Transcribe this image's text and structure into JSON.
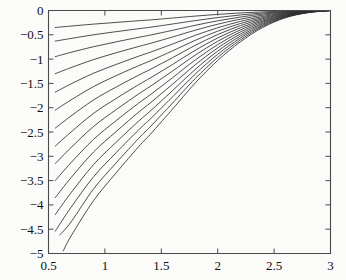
{
  "chart_data": {
    "type": "line",
    "title": "",
    "subtitle": "",
    "xlabel": "",
    "ylabel": "",
    "xlim": [
      0.5,
      3.0
    ],
    "ylim": [
      -5.0,
      0.0
    ],
    "grid": false,
    "legend": "none",
    "legend_entries": [],
    "annotations": [],
    "x_ticks": [
      0.5,
      1,
      1.5,
      2,
      2.5,
      3
    ],
    "x_tick_labels": [
      "0.5",
      "1",
      "1.5",
      "2",
      "2.5",
      "3"
    ],
    "y_ticks": [
      0,
      -0.5,
      -1,
      -1.5,
      -2,
      -2.5,
      -3,
      -3.5,
      -4,
      -4.5,
      -5
    ],
    "y_tick_labels": [
      "0",
      "−0.5",
      "−1",
      "−1.5",
      "−2",
      "−2.5",
      "−3",
      "−3.5",
      "−4",
      "−4.5",
      "−5"
    ],
    "right_axis_minor_ticks": 10,
    "top_axis_minor_ticks": 5,
    "line_color": "#2e2e2e",
    "axis_color": "#4a4a4a",
    "background_color": "#fbfbfa",
    "series_count": 15,
    "series": [
      {
        "name": "curve-1",
        "x": [
          0.56,
          0.7,
          0.9,
          1.1,
          1.3,
          1.4,
          1.5,
          1.6,
          1.8,
          2.0,
          2.2,
          2.4,
          2.6,
          2.8,
          3.0
        ],
        "values": [
          -0.35,
          -0.32,
          -0.28,
          -0.245,
          -0.21,
          -0.195,
          -0.175,
          -0.155,
          -0.115,
          -0.08,
          -0.05,
          -0.028,
          -0.012,
          -0.004,
          0.0
        ]
      },
      {
        "name": "curve-2",
        "x": [
          0.56,
          0.7,
          0.9,
          1.1,
          1.3,
          1.4,
          1.5,
          1.6,
          1.8,
          2.0,
          2.2,
          2.4,
          2.6,
          2.8,
          3.0
        ],
        "values": [
          -0.63,
          -0.575,
          -0.5,
          -0.435,
          -0.375,
          -0.345,
          -0.312,
          -0.278,
          -0.208,
          -0.145,
          -0.092,
          -0.05,
          -0.022,
          -0.007,
          0.0
        ]
      },
      {
        "name": "curve-3",
        "x": [
          0.56,
          0.7,
          0.9,
          1.1,
          1.3,
          1.4,
          1.5,
          1.6,
          1.8,
          2.0,
          2.2,
          2.4,
          2.6,
          2.8,
          3.0
        ],
        "values": [
          -0.95,
          -0.86,
          -0.745,
          -0.645,
          -0.552,
          -0.507,
          -0.458,
          -0.408,
          -0.305,
          -0.212,
          -0.135,
          -0.073,
          -0.032,
          -0.01,
          0.0
        ]
      },
      {
        "name": "curve-4",
        "x": [
          0.56,
          0.7,
          0.9,
          1.1,
          1.3,
          1.4,
          1.5,
          1.6,
          1.8,
          2.0,
          2.2,
          2.4,
          2.6,
          2.8,
          3.0
        ],
        "values": [
          -1.3,
          -1.175,
          -1.01,
          -0.87,
          -0.74,
          -0.678,
          -0.612,
          -0.545,
          -0.406,
          -0.282,
          -0.179,
          -0.097,
          -0.042,
          -0.013,
          0.0
        ]
      },
      {
        "name": "curve-5",
        "x": [
          0.56,
          0.7,
          0.9,
          1.1,
          1.3,
          1.4,
          1.5,
          1.6,
          1.8,
          2.0,
          2.2,
          2.4,
          2.6,
          2.8,
          3.0
        ],
        "values": [
          -1.68,
          -1.51,
          -1.29,
          -1.11,
          -0.94,
          -0.86,
          -0.775,
          -0.69,
          -0.512,
          -0.355,
          -0.225,
          -0.122,
          -0.053,
          -0.016,
          0.0
        ]
      },
      {
        "name": "curve-6",
        "x": [
          0.56,
          0.7,
          0.9,
          1.1,
          1.3,
          1.4,
          1.5,
          1.6,
          1.8,
          2.0,
          2.2,
          2.4,
          2.6,
          2.8,
          3.0
        ],
        "values": [
          -2.05,
          -1.84,
          -1.565,
          -1.34,
          -1.135,
          -1.038,
          -0.935,
          -0.83,
          -0.615,
          -0.425,
          -0.269,
          -0.146,
          -0.063,
          -0.019,
          0.0
        ]
      },
      {
        "name": "curve-7",
        "x": [
          0.56,
          0.7,
          0.9,
          1.1,
          1.3,
          1.4,
          1.5,
          1.6,
          1.8,
          2.0,
          2.2,
          2.4,
          2.6,
          2.8,
          3.0
        ],
        "values": [
          -2.42,
          -2.17,
          -1.84,
          -1.575,
          -1.33,
          -1.215,
          -1.093,
          -0.97,
          -0.718,
          -0.495,
          -0.313,
          -0.169,
          -0.073,
          -0.022,
          0.0
        ]
      },
      {
        "name": "curve-8",
        "x": [
          0.56,
          0.7,
          0.9,
          1.1,
          1.3,
          1.4,
          1.5,
          1.6,
          1.8,
          2.0,
          2.2,
          2.4,
          2.6,
          2.8,
          3.0
        ],
        "values": [
          -2.79,
          -2.5,
          -2.115,
          -1.81,
          -1.525,
          -1.392,
          -1.251,
          -1.11,
          -0.82,
          -0.565,
          -0.357,
          -0.193,
          -0.083,
          -0.025,
          0.0
        ]
      },
      {
        "name": "curve-9",
        "x": [
          0.56,
          0.7,
          0.9,
          1.1,
          1.3,
          1.4,
          1.5,
          1.6,
          1.8,
          2.0,
          2.2,
          2.4,
          2.6,
          2.8,
          3.0
        ],
        "values": [
          -3.15,
          -2.82,
          -2.385,
          -2.04,
          -1.715,
          -1.565,
          -1.405,
          -1.245,
          -0.92,
          -0.633,
          -0.4,
          -0.216,
          -0.093,
          -0.028,
          0.0
        ]
      },
      {
        "name": "curve-10",
        "x": [
          0.56,
          0.7,
          0.9,
          1.1,
          1.3,
          1.4,
          1.5,
          1.6,
          1.8,
          2.0,
          2.2,
          2.4,
          2.6,
          2.8,
          3.0
        ],
        "values": [
          -3.5,
          -3.13,
          -2.65,
          -2.265,
          -1.905,
          -1.738,
          -1.56,
          -1.382,
          -1.02,
          -0.702,
          -0.443,
          -0.239,
          -0.103,
          -0.031,
          0.0
        ]
      },
      {
        "name": "curve-11",
        "x": [
          0.56,
          0.7,
          0.9,
          1.1,
          1.3,
          1.4,
          1.5,
          1.6,
          1.8,
          2.0,
          2.2,
          2.4,
          2.6,
          2.8,
          3.0
        ],
        "values": [
          -3.85,
          -3.44,
          -2.91,
          -2.49,
          -2.09,
          -1.908,
          -1.712,
          -1.516,
          -1.119,
          -0.77,
          -0.486,
          -0.262,
          -0.113,
          -0.034,
          0.0
        ]
      },
      {
        "name": "curve-12",
        "x": [
          0.56,
          0.7,
          0.9,
          1.1,
          1.3,
          1.4,
          1.5,
          1.6,
          1.8,
          2.0,
          2.2,
          2.4,
          2.6,
          2.8,
          3.0
        ],
        "values": [
          -4.2,
          -3.75,
          -3.17,
          -2.71,
          -2.275,
          -2.075,
          -1.862,
          -1.648,
          -1.215,
          -0.836,
          -0.527,
          -0.284,
          -0.122,
          -0.037,
          0.0
        ]
      },
      {
        "name": "curve-13",
        "x": [
          0.56,
          0.7,
          0.9,
          1.1,
          1.3,
          1.4,
          1.5,
          1.6,
          1.8,
          2.0,
          2.2,
          2.4,
          2.6,
          2.8,
          3.0
        ],
        "values": [
          -4.54,
          -4.05,
          -3.42,
          -2.925,
          -2.455,
          -2.238,
          -2.008,
          -1.777,
          -1.31,
          -0.901,
          -0.568,
          -0.306,
          -0.132,
          -0.04,
          0.0
        ]
      },
      {
        "name": "curve-14",
        "x": [
          0.6,
          0.7,
          0.9,
          1.1,
          1.3,
          1.4,
          1.5,
          1.6,
          1.8,
          2.0,
          2.2,
          2.4,
          2.6,
          2.8,
          3.0
        ],
        "values": [
          -4.62,
          -4.35,
          -3.67,
          -3.135,
          -2.63,
          -2.398,
          -2.152,
          -1.904,
          -1.403,
          -0.965,
          -0.608,
          -0.328,
          -0.141,
          -0.043,
          0.0
        ]
      },
      {
        "name": "curve-15",
        "x": [
          0.63,
          0.7,
          0.9,
          1.1,
          1.3,
          1.4,
          1.5,
          1.6,
          1.8,
          2.0,
          2.2,
          2.4,
          2.6,
          2.8,
          3.0
        ],
        "values": [
          -4.95,
          -4.64,
          -3.91,
          -3.34,
          -2.8,
          -2.555,
          -2.292,
          -2.028,
          -1.494,
          -1.028,
          -0.647,
          -0.349,
          -0.15,
          -0.045,
          0.0
        ]
      }
    ]
  }
}
